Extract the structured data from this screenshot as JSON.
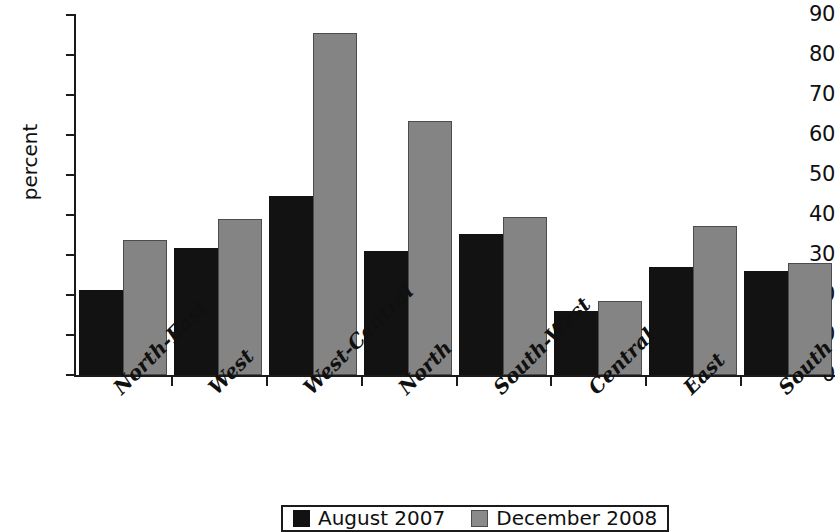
{
  "chart_data": {
    "type": "bar",
    "title": "",
    "subtitle": "",
    "xlabel": "",
    "ylabel": "percent",
    "ylim": [
      0,
      90
    ],
    "ytick_labels": [
      "90",
      "80",
      "70",
      "60",
      "50",
      "40",
      "30",
      "20",
      "10",
      "0"
    ],
    "ytick_values": [
      90,
      80,
      70,
      60,
      50,
      40,
      30,
      20,
      10,
      0
    ],
    "grid": false,
    "legend_position": "bottom",
    "categories": [
      "North-East",
      "West",
      "West-Central",
      "North",
      "South-West",
      "Central",
      "East",
      "South"
    ],
    "series": [
      {
        "name": "August 2007",
        "color": "#121212",
        "values": [
          21.2,
          31.7,
          44.7,
          30.9,
          35.3,
          16.1,
          26.9,
          26.0
        ]
      },
      {
        "name": "December 2008",
        "color": "#848484",
        "values": [
          33.7,
          38.9,
          85.4,
          63.5,
          39.6,
          18.4,
          37.3,
          28.0
        ]
      }
    ]
  },
  "legend": {
    "entries": [
      {
        "label": "August 2007",
        "swatch": "black-swatch"
      },
      {
        "label": "December 2008",
        "swatch": "gray-swatch"
      }
    ]
  },
  "colors": {
    "series_black": "#121212",
    "series_gray": "#848484",
    "axis": "#1b1b1b",
    "background": "#ffffff"
  }
}
